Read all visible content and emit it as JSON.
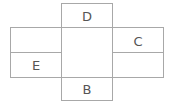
{
  "diagram": {
    "type": "box-net",
    "stroke_color": "#a8a8a8",
    "label_color": "#555555",
    "faces": [
      {
        "id": "top",
        "label": "D"
      },
      {
        "id": "left-upper",
        "label": ""
      },
      {
        "id": "left-lower",
        "label": "E"
      },
      {
        "id": "center",
        "label": ""
      },
      {
        "id": "right-upper",
        "label": "C"
      },
      {
        "id": "right-lower",
        "label": ""
      },
      {
        "id": "bottom",
        "label": "B"
      }
    ]
  }
}
